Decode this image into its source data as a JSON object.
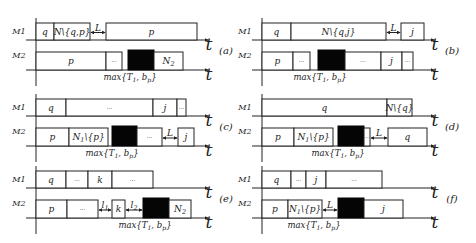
{
  "figure": {
    "machine_labels": [
      "M1",
      "M2"
    ],
    "time_label": "t",
    "max_label": "max{T1, bp}",
    "panels": [
      {
        "id": "a",
        "caption": "(a)",
        "x0": 36,
        "y0": 18,
        "m1": [
          {
            "x": 36,
            "w": 18,
            "label": "q",
            "type": "box"
          },
          {
            "x": 54,
            "w": 36,
            "label": "N\\{q,p}",
            "type": "box"
          },
          {
            "x": 90,
            "w": 16,
            "label": "L",
            "type": "gap"
          },
          {
            "x": 106,
            "w": 91,
            "label": "p",
            "type": "box"
          }
        ],
        "m2": [
          {
            "x": 36,
            "w": 70,
            "label": "p",
            "type": "box"
          },
          {
            "x": 106,
            "w": 16,
            "label": "...",
            "type": "box"
          },
          {
            "x": 128,
            "w": 26,
            "label": "",
            "type": "black"
          },
          {
            "x": 154,
            "w": 29,
            "label": "N2",
            "type": "box"
          }
        ],
        "max_x": 130
      },
      {
        "id": "b",
        "caption": "(b)",
        "x0": 262,
        "y0": 18,
        "m1": [
          {
            "x": 262,
            "w": 29,
            "label": "q",
            "type": "box"
          },
          {
            "x": 291,
            "w": 95,
            "label": "N\\{q,j}",
            "type": "box"
          },
          {
            "x": 386,
            "w": 15,
            "label": "L",
            "type": "gap"
          },
          {
            "x": 401,
            "w": 23,
            "label": "j",
            "type": "box"
          }
        ],
        "m2": [
          {
            "x": 262,
            "w": 31,
            "label": "p",
            "type": "box"
          },
          {
            "x": 293,
            "w": 17,
            "label": "...",
            "type": "box"
          },
          {
            "x": 318,
            "w": 27,
            "label": "",
            "type": "black"
          },
          {
            "x": 345,
            "w": 36,
            "label": "...",
            "type": "box"
          },
          {
            "x": 381,
            "w": 21,
            "label": "j",
            "type": "box"
          },
          {
            "x": 402,
            "w": 11,
            "label": "...",
            "type": "box"
          }
        ],
        "max_x": 320
      },
      {
        "id": "c",
        "caption": "(c)",
        "x0": 36,
        "y0": 94,
        "m1": [
          {
            "x": 36,
            "w": 30,
            "label": "q",
            "type": "box"
          },
          {
            "x": 66,
            "w": 87,
            "label": "...",
            "type": "box"
          },
          {
            "x": 153,
            "w": 24,
            "label": "j",
            "type": "box"
          },
          {
            "x": 177,
            "w": 9,
            "label": "...",
            "type": "box"
          }
        ],
        "m2": [
          {
            "x": 36,
            "w": 33,
            "label": "p",
            "type": "box"
          },
          {
            "x": 69,
            "w": 39,
            "label": "N1\\{p}",
            "type": "box"
          },
          {
            "x": 112,
            "w": 25,
            "label": "",
            "type": "black"
          },
          {
            "x": 137,
            "w": 25,
            "label": "...",
            "type": "box"
          },
          {
            "x": 162,
            "w": 16,
            "label": "L",
            "type": "gap"
          },
          {
            "x": 178,
            "w": 16,
            "label": "j",
            "type": "box"
          }
        ],
        "max_x": 112
      },
      {
        "id": "d",
        "caption": "(d)",
        "x0": 262,
        "y0": 94,
        "m1": [
          {
            "x": 262,
            "w": 125,
            "label": "q",
            "type": "box"
          },
          {
            "x": 387,
            "w": 25,
            "label": "N\\{q}",
            "type": "box"
          }
        ],
        "m2": [
          {
            "x": 262,
            "w": 32,
            "label": "p",
            "type": "box"
          },
          {
            "x": 294,
            "w": 39,
            "label": "N1\\{p}",
            "type": "box"
          },
          {
            "x": 338,
            "w": 26,
            "label": "",
            "type": "black"
          },
          {
            "x": 364,
            "w": 6,
            "label": "..",
            "type": "box"
          },
          {
            "x": 370,
            "w": 18,
            "label": "L",
            "type": "gap"
          },
          {
            "x": 388,
            "w": 39,
            "label": "q",
            "type": "box"
          }
        ],
        "max_x": 338
      },
      {
        "id": "e",
        "caption": "(e)",
        "x0": 36,
        "y0": 166,
        "m1": [
          {
            "x": 36,
            "w": 30,
            "label": "q",
            "type": "box"
          },
          {
            "x": 66,
            "w": 22,
            "label": "...",
            "type": "box"
          },
          {
            "x": 88,
            "w": 24,
            "label": "k",
            "type": "box"
          },
          {
            "x": 112,
            "w": 41,
            "label": "...",
            "type": "box"
          }
        ],
        "m2": [
          {
            "x": 36,
            "w": 31,
            "label": "p",
            "type": "box"
          },
          {
            "x": 67,
            "w": 31,
            "label": "...",
            "type": "box"
          },
          {
            "x": 98,
            "w": 14,
            "label": "l1",
            "type": "gap"
          },
          {
            "x": 112,
            "w": 13,
            "label": "k",
            "type": "box"
          },
          {
            "x": 125,
            "w": 18,
            "label": "l2",
            "type": "gap"
          },
          {
            "x": 143,
            "w": 26,
            "label": "",
            "type": "black"
          },
          {
            "x": 169,
            "w": 22,
            "label": "N2",
            "type": "box"
          }
        ],
        "max_x": 145
      },
      {
        "id": "f",
        "caption": "(f)",
        "x0": 262,
        "y0": 166,
        "m1": [
          {
            "x": 262,
            "w": 29,
            "label": "q",
            "type": "box"
          },
          {
            "x": 291,
            "w": 15,
            "label": "...",
            "type": "box"
          },
          {
            "x": 306,
            "w": 20,
            "label": "j",
            "type": "box"
          },
          {
            "x": 326,
            "w": 56,
            "label": "...",
            "type": "box"
          }
        ],
        "m2": [
          {
            "x": 262,
            "w": 26,
            "label": "p",
            "type": "box"
          },
          {
            "x": 288,
            "w": 34,
            "label": "N1\\{p}",
            "type": "box"
          },
          {
            "x": 322,
            "w": 16,
            "label": "L",
            "type": "gap"
          },
          {
            "x": 338,
            "w": 26,
            "label": "",
            "type": "black"
          },
          {
            "x": 364,
            "w": 39,
            "label": "j",
            "type": "box"
          }
        ],
        "max_x": 314
      }
    ]
  }
}
